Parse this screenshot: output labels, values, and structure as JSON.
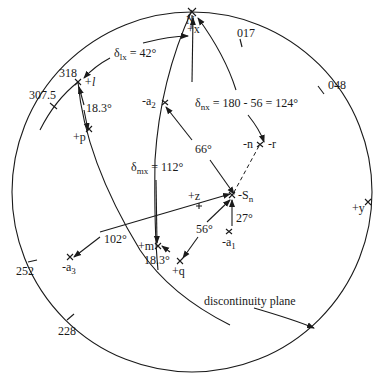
{
  "diagram": {
    "type": "stereonet",
    "north_label": "N",
    "azimuth_ticks": [
      {
        "label": "017",
        "x": 237,
        "y": 33
      },
      {
        "label": "048",
        "x": 322,
        "y": 89
      },
      {
        "label": "318",
        "x": 65,
        "y": 75
      },
      {
        "label": "307.5",
        "x": 45,
        "y": 102
      },
      {
        "label": "252",
        "x": 22,
        "y": 278
      },
      {
        "label": "228",
        "x": 70,
        "y": 326
      }
    ],
    "points": [
      {
        "id": "plus_x",
        "label": "+x"
      },
      {
        "id": "plus_l",
        "label": "+l"
      },
      {
        "id": "plus_p",
        "label": "+p"
      },
      {
        "id": "minus_a2",
        "label": "-a",
        "sub": "2"
      },
      {
        "id": "minus_n",
        "label": "-n"
      },
      {
        "id": "minus_r",
        "label": "-r"
      },
      {
        "id": "minus_Sn",
        "label": "-S",
        "sub": "n"
      },
      {
        "id": "plus_z",
        "label": "+z"
      },
      {
        "id": "minus_a1",
        "label": "-a",
        "sub": "1"
      },
      {
        "id": "plus_y",
        "label": "+y"
      },
      {
        "id": "plus_m",
        "label": "+m"
      },
      {
        "id": "plus_q",
        "label": "+q"
      },
      {
        "id": "minus_a3",
        "label": "-a",
        "sub": "3"
      }
    ],
    "annotations": {
      "delta_lx": {
        "sym": "δ",
        "sub": "lx",
        "text": " = 42°"
      },
      "delta_nx": {
        "sym": "δ",
        "sub": "nx",
        "text": " = 180 - 56 = 124°"
      },
      "delta_mx": {
        "sym": "δ",
        "sub": "mx",
        "text": " = 112°"
      },
      "angle_lp": "18.3°",
      "angle_66": "66°",
      "angle_27": "27°",
      "angle_56": "56°",
      "angle_102": "102°",
      "angle_mq": "18.3°",
      "plane_label": "discontinuity plane"
    }
  }
}
